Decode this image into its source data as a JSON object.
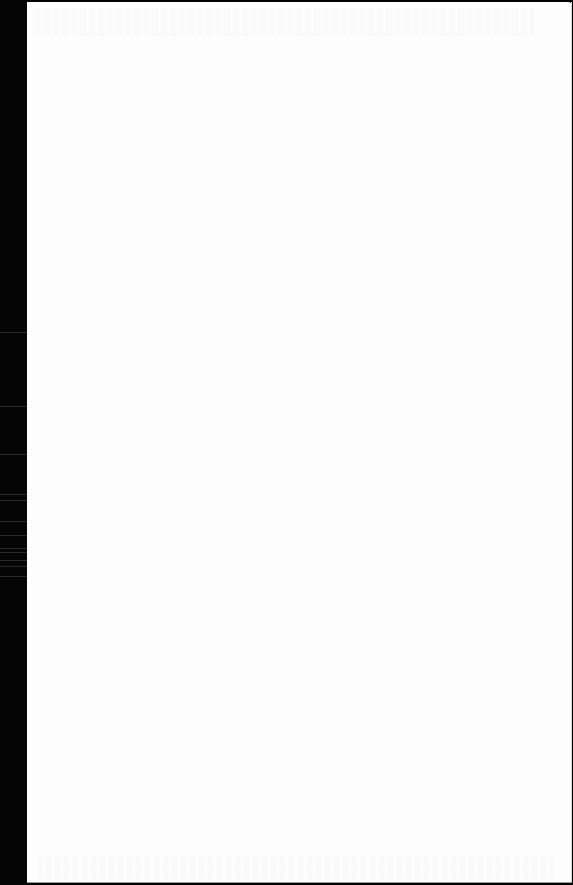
{
  "document": {
    "type": "scanned-blank-page",
    "text": "",
    "colors": {
      "page_background": "#fdfdfd",
      "scan_border": "#000000"
    }
  }
}
